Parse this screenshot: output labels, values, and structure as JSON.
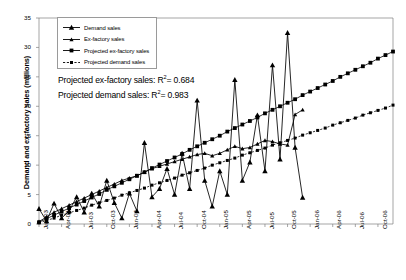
{
  "chart_data": {
    "type": "line",
    "title": "",
    "xlabel": "",
    "ylabel": "Demand and ex-factory sales (millions)",
    "ylim": [
      0,
      35
    ],
    "yticks": [
      0,
      5,
      10,
      15,
      20,
      25,
      30,
      35
    ],
    "grid": false,
    "legend_position": "top-left",
    "x": [
      "Jan-03",
      "Feb-03",
      "Mar-03",
      "Apr-03",
      "May-03",
      "Jun-03",
      "Jul-03",
      "Aug-03",
      "Sep-03",
      "Oct-03",
      "Nov-03",
      "Dec-03",
      "Jan-04",
      "Feb-04",
      "Mar-04",
      "Apr-04",
      "May-04",
      "Jun-04",
      "Jul-04",
      "Aug-04",
      "Sep-04",
      "Oct-04",
      "Nov-04",
      "Dec-04",
      "Jan-05",
      "Feb-05",
      "Mar-05",
      "Apr-05",
      "May-05",
      "Jun-05",
      "Jul-05",
      "Aug-05",
      "Sep-05",
      "Oct-05",
      "Nov-05",
      "Dec-05",
      "Jan-06",
      "Feb-06",
      "Mar-06",
      "Apr-06",
      "May-06",
      "Jun-06",
      "Jul-06",
      "Aug-06",
      "Sep-06",
      "Oct-06",
      "Nov-06",
      "Dec-06"
    ],
    "xticks": [
      "Jan-03",
      "Apr-03",
      "Jul-03",
      "Oct-03",
      "Jan-04",
      "Apr-04",
      "Jul-04",
      "Oct-04",
      "Jan-05",
      "Apr-05",
      "Jul-05",
      "Oct-05",
      "Jan-06",
      "Apr-06",
      "Jul-06",
      "Oct-06"
    ],
    "series": [
      {
        "name": "Demand sales",
        "marker": "triangle",
        "values": [
          2.6,
          0.5,
          3.5,
          1.0,
          2.2,
          4.6,
          2.0,
          5.2,
          3.0,
          7.4,
          3.6,
          1.0,
          5.2,
          2.2,
          13.8,
          4.6,
          6.0,
          9.4,
          5.0,
          12.0,
          6.0,
          21.0,
          7.4,
          3.0,
          9.0,
          5.0,
          24.5,
          7.4,
          10.5,
          18.5,
          9.0,
          27.0,
          11.0,
          32.5,
          13.0,
          4.5,
          null,
          null,
          null,
          null,
          null,
          null,
          null,
          null,
          null,
          null,
          null,
          null
        ]
      },
      {
        "name": "Ex-factory sales",
        "marker": "triangle-small",
        "values": [
          0.4,
          1.2,
          2.0,
          2.6,
          3.2,
          3.8,
          4.4,
          5.0,
          5.6,
          6.2,
          6.8,
          7.4,
          7.8,
          8.2,
          8.8,
          9.4,
          9.8,
          10.2,
          10.6,
          11.0,
          11.4,
          11.8,
          12.0,
          11.6,
          12.0,
          12.6,
          13.2,
          12.8,
          13.0,
          13.6,
          14.2,
          14.0,
          13.6,
          13.4,
          18.6,
          19.4,
          null,
          null,
          null,
          null,
          null,
          null,
          null,
          null,
          null,
          null,
          null,
          null
        ]
      },
      {
        "name": "Projected ex-factory sales",
        "marker": "square",
        "values": [
          0.3,
          0.9,
          1.5,
          2.1,
          2.7,
          3.3,
          3.9,
          4.5,
          5.1,
          5.8,
          6.4,
          7.0,
          7.6,
          8.2,
          8.8,
          9.5,
          10.1,
          10.7,
          11.3,
          11.9,
          12.6,
          13.2,
          13.8,
          14.4,
          15.0,
          15.7,
          16.3,
          16.9,
          17.5,
          18.1,
          18.8,
          19.4,
          20.0,
          20.6,
          21.2,
          21.9,
          22.5,
          23.1,
          23.7,
          24.3,
          25.0,
          25.6,
          26.2,
          26.8,
          27.4,
          28.1,
          28.7,
          29.3
        ]
      },
      {
        "name": "Projected demand sales",
        "marker": "square-small",
        "values": [
          0.2,
          0.6,
          1.0,
          1.5,
          1.9,
          2.3,
          2.7,
          3.2,
          3.6,
          4.0,
          4.4,
          4.9,
          5.3,
          5.7,
          6.1,
          6.6,
          7.0,
          7.4,
          7.8,
          8.3,
          8.7,
          9.1,
          9.5,
          10.0,
          10.4,
          10.8,
          11.2,
          11.7,
          12.1,
          12.5,
          12.9,
          13.4,
          13.8,
          14.2,
          14.6,
          15.1,
          15.5,
          15.9,
          16.3,
          16.8,
          17.2,
          17.6,
          18.0,
          18.5,
          18.9,
          19.3,
          19.7,
          20.2
        ]
      }
    ],
    "annotations": [
      {
        "id": "r2_exfactory",
        "prefix": "Projected ex-factory sales:  R",
        "sup": "2",
        "suffix": "= 0.684"
      },
      {
        "id": "r2_demand",
        "prefix": "Projected demand sales:  R",
        "sup": "2",
        "suffix": "= 0.983"
      }
    ]
  },
  "legend": {
    "items": [
      {
        "label": "Demand sales"
      },
      {
        "label": "Ex-factory sales"
      },
      {
        "label": "Projected ex-factory sales"
      },
      {
        "label": "Projected demand sales"
      }
    ]
  },
  "colors": {
    "line": "#000000",
    "axis": "#808080",
    "background": "#ffffff"
  }
}
